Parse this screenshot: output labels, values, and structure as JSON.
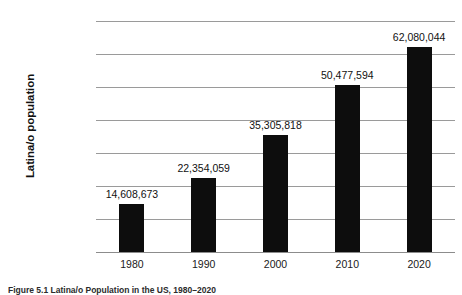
{
  "chart_data": {
    "type": "bar",
    "title": "",
    "xlabel": "",
    "ylabel": "Latina/o population",
    "categories": [
      "1980",
      "1990",
      "2000",
      "2010",
      "2020"
    ],
    "values": [
      14608673,
      22354059,
      35305818,
      50477594,
      62080044
    ],
    "value_labels": [
      "14,608,673",
      "22,354,059",
      "35,305,818",
      "50,477,594",
      "62,080,044"
    ],
    "ylim": [
      0,
      70000000
    ],
    "ytick_values": [
      0,
      10000000,
      20000000,
      30000000,
      40000000,
      50000000,
      60000000,
      70000000
    ],
    "ytick_labels": [
      "0",
      "10,000,000",
      "20,000,000",
      "30,000,000",
      "40,000,000",
      "50,000,000",
      "60,000,000",
      "70,000,000"
    ],
    "grid": true,
    "legend": "none",
    "bar_color": "#0d0d0d",
    "gridline_color": "#9a9a9a",
    "background_color": "#ffffff"
  },
  "caption": {
    "label": "Figure 5.1",
    "text": "Latina/o Population in the US, 1980–2020"
  }
}
